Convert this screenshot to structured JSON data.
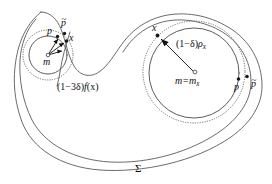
{
  "figure": {
    "name": "set-sigma-with-two-ball-neighborhoods",
    "background_color": "#ffffff",
    "stroke_color": "#5a5a5a",
    "accent_color": "#111111"
  },
  "labels": {
    "region": "Σ",
    "left": {
      "p": "p",
      "p_bar_base": "p",
      "p_bar_accent": "~",
      "x": "x",
      "m": "m",
      "radius_annotation_prefix": "(1−3δ)",
      "radius_annotation_fn": "f",
      "radius_annotation_arg": "(x)"
    },
    "right": {
      "x": "x",
      "radius_prefix": "(1−δ)",
      "radius_rho": "ρ",
      "radius_rho_sub": "x",
      "center_eq": "m=m",
      "center_eq_sub": "x",
      "p": "p",
      "p_bar_base": "p",
      "p_bar_accent": "~"
    }
  },
  "geometry": {
    "left_circle": {
      "cx": 48,
      "cy": 55,
      "r": 19
    },
    "left_dotted_circle": {
      "cx": 48,
      "cy": 55,
      "r": 25
    },
    "right_circle": {
      "cx": 194,
      "cy": 73,
      "r": 45
    },
    "right_dotted_circle": {
      "cx": 194,
      "cy": 72,
      "r": 51
    },
    "marker_points": [
      {
        "name": "left-p",
        "x": 57,
        "y": 36
      },
      {
        "name": "left-p-bar",
        "x": 65,
        "y": 33
      },
      {
        "name": "left-x",
        "x": 67,
        "y": 41
      },
      {
        "name": "left-m",
        "x": 48,
        "y": 55
      },
      {
        "name": "right-x",
        "x": 157,
        "y": 35
      },
      {
        "name": "right-m",
        "x": 195,
        "y": 72
      },
      {
        "name": "right-p",
        "x": 238,
        "y": 79
      },
      {
        "name": "right-p-bar",
        "x": 247,
        "y": 77
      }
    ]
  }
}
